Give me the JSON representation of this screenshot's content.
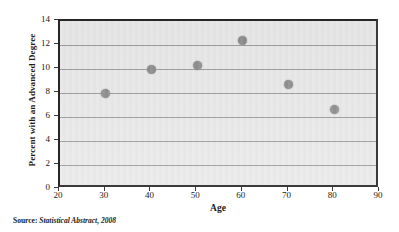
{
  "chart_data": {
    "type": "scatter",
    "title": "",
    "xlabel": "Age",
    "ylabel": "Percent with an Advanced Degree",
    "xlim": [
      20,
      90
    ],
    "ylim": [
      0,
      14
    ],
    "xticks": [
      20,
      30,
      40,
      50,
      60,
      70,
      80,
      90
    ],
    "yticks": [
      0,
      2,
      4,
      6,
      8,
      10,
      12,
      14
    ],
    "grid": "horizontal",
    "legend": "none",
    "marker_color": "#8c8c8c",
    "plot_background": "#e9e9e9",
    "x": [
      30,
      40,
      50,
      60,
      70,
      80
    ],
    "values": [
      8.0,
      10.0,
      10.3,
      12.4,
      8.75,
      6.65
    ],
    "points": [
      {
        "x": 30,
        "y": 8.0
      },
      {
        "x": 40,
        "y": 10.0
      },
      {
        "x": 50,
        "y": 10.3
      },
      {
        "x": 60,
        "y": 12.4
      },
      {
        "x": 70,
        "y": 8.75
      },
      {
        "x": 80,
        "y": 6.65
      }
    ]
  },
  "axes": {
    "y_title": "Percent with an Advanced Degree",
    "x_title": "Age",
    "y_tick_labels": [
      "0",
      "2",
      "4",
      "6",
      "8",
      "10",
      "12",
      "14"
    ],
    "x_tick_labels": [
      "20",
      "30",
      "40",
      "50",
      "60",
      "70",
      "80",
      "90"
    ]
  },
  "caption": {
    "label": "Source: ",
    "work": "Statistical Abstract, 2008"
  }
}
